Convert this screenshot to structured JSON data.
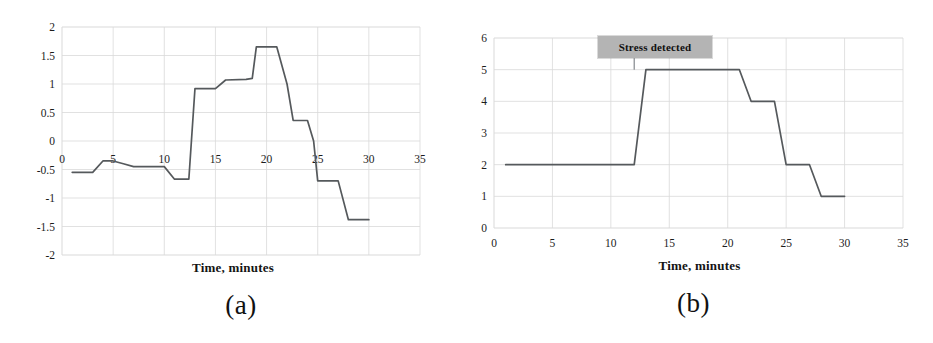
{
  "figure": {
    "panels": [
      {
        "id": "a",
        "caption": "(a)",
        "xlabel": "Time, minutes",
        "ylabel": ""
      },
      {
        "id": "b",
        "caption": "(b)",
        "xlabel": "Time, minutes",
        "ylabel": ""
      }
    ],
    "line_color": "#55595c",
    "grid_color": "#d9d9d9",
    "annotation_bg": "#b4b4b4"
  },
  "annotations": {
    "stress_detected": "Stress detected"
  },
  "chart_data": [
    {
      "type": "line",
      "id": "a",
      "title": "",
      "subtitle": "(a)",
      "xlabel": "Time, minutes",
      "ylabel": "",
      "xlim": [
        0,
        35
      ],
      "ylim": [
        -2,
        2
      ],
      "xticks": [
        0,
        5,
        10,
        15,
        20,
        25,
        30,
        35
      ],
      "yticks": [
        -2,
        -1.5,
        -1,
        -0.5,
        0,
        0.5,
        1,
        1.5,
        2
      ],
      "xticklabels": [
        "0",
        "5",
        "10",
        "15",
        "20",
        "25",
        "30",
        "35"
      ],
      "yticklabels": [
        "-2",
        "-1.5",
        "-1",
        "-0.5",
        "0",
        "0.5",
        "1",
        "1.5",
        "2"
      ],
      "grid": true,
      "legend": null,
      "series": [
        {
          "name": "normalized stress index",
          "x": [
            1,
            3,
            4,
            5,
            6,
            7,
            9,
            10,
            11,
            12,
            12.4,
            13,
            15,
            16,
            18,
            18.6,
            19,
            21,
            22,
            22.6,
            24,
            24.6,
            25,
            27,
            28,
            30
          ],
          "y": [
            -0.55,
            -0.55,
            -0.35,
            -0.35,
            -0.4,
            -0.45,
            -0.45,
            -0.45,
            -0.67,
            -0.67,
            -0.67,
            0.92,
            0.92,
            1.07,
            1.08,
            1.1,
            1.65,
            1.65,
            1.0,
            0.36,
            0.36,
            0.0,
            -0.7,
            -0.7,
            -1.38,
            -1.38
          ]
        }
      ]
    },
    {
      "type": "line",
      "id": "b",
      "title": "",
      "subtitle": "(b)",
      "xlabel": "Time, minutes",
      "ylabel": "",
      "xlim": [
        0,
        35
      ],
      "ylim": [
        0,
        6
      ],
      "xticks": [
        0,
        5,
        10,
        15,
        20,
        25,
        30,
        35
      ],
      "yticks": [
        0,
        1,
        2,
        3,
        4,
        5,
        6
      ],
      "xticklabels": [
        "0",
        "5",
        "10",
        "15",
        "20",
        "25",
        "30",
        "35"
      ],
      "yticklabels": [
        "0",
        "1",
        "2",
        "3",
        "4",
        "5",
        "6"
      ],
      "grid": true,
      "legend": null,
      "annotations": [
        {
          "text": "Stress detected",
          "x": 12,
          "y": 5.4,
          "pointer_to_x": 12,
          "pointer_to_y": 5.0
        }
      ],
      "series": [
        {
          "name": "stress level",
          "x": [
            1,
            12,
            13,
            21,
            22,
            24,
            25,
            27,
            28,
            30
          ],
          "y": [
            2,
            2,
            5,
            5,
            4,
            4,
            2,
            2,
            1,
            1
          ]
        }
      ]
    }
  ]
}
